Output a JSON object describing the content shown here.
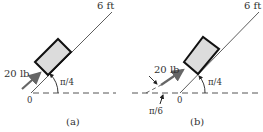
{
  "figure": {
    "panels": [
      {
        "id": "a",
        "caption": "(a)",
        "length_label": "6 ft",
        "force_label": "20 lb",
        "incline_angle_label": "π/4",
        "origin_label": "0"
      },
      {
        "id": "b",
        "caption": "(b)",
        "length_label": "6 ft",
        "force_label": "20 lb",
        "incline_angle_label": "π/4",
        "force_angle_label": "π/6",
        "origin_label": "0"
      }
    ],
    "colors": {
      "line": "#333333",
      "box_fill": "#dcdcdc",
      "box_stroke": "#111111",
      "force_arrow": "#666666",
      "dashed": "#555555"
    }
  }
}
